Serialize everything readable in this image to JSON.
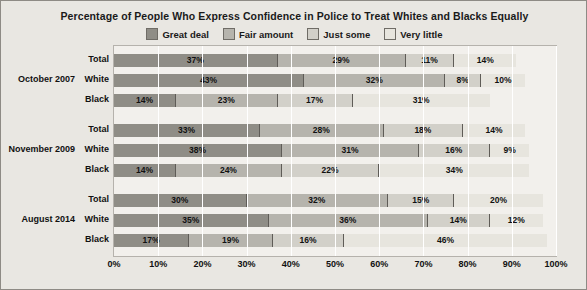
{
  "chart_data": {
    "type": "bar",
    "orientation": "horizontal-stacked",
    "title": "Percentage of People Who Express Confidence in Police to Treat Whites and Blacks Equally",
    "xlabel": "",
    "ylabel": "",
    "xlim": [
      0,
      100
    ],
    "xticks": [
      "0%",
      "10%",
      "20%",
      "30%",
      "40%",
      "50%",
      "60%",
      "70%",
      "80%",
      "90%",
      "100%"
    ],
    "xtick_values": [
      0,
      10,
      20,
      30,
      40,
      50,
      60,
      70,
      80,
      90,
      100
    ],
    "grid": true,
    "legend_position": "top",
    "legend": [
      {
        "name": "Great deal",
        "color": "#8f8d86"
      },
      {
        "name": "Fair amount",
        "color": "#b6b4ad"
      },
      {
        "name": "Just some",
        "color": "#d2d0c9"
      },
      {
        "name": "Very little",
        "color": "#e7e5de"
      }
    ],
    "groups": [
      {
        "label": "October 2007",
        "rows": [
          {
            "category": "Total",
            "values": [
              37,
              29,
              11,
              14
            ],
            "labels": [
              "37%",
              "29%",
              "11%",
              "14%"
            ]
          },
          {
            "category": "White",
            "values": [
              43,
              32,
              8,
              10
            ],
            "labels": [
              "43%",
              "32%",
              "8%",
              "10%"
            ]
          },
          {
            "category": "Black",
            "values": [
              14,
              23,
              17,
              31
            ],
            "labels": [
              "14%",
              "23%",
              "17%",
              "31%"
            ]
          }
        ]
      },
      {
        "label": "November 2009",
        "rows": [
          {
            "category": "Total",
            "values": [
              33,
              28,
              18,
              14
            ],
            "labels": [
              "33%",
              "28%",
              "18%",
              "14%"
            ]
          },
          {
            "category": "White",
            "values": [
              38,
              31,
              16,
              9
            ],
            "labels": [
              "38%",
              "31%",
              "16%",
              "9%"
            ]
          },
          {
            "category": "Black",
            "values": [
              14,
              24,
              22,
              34
            ],
            "labels": [
              "14%",
              "24%",
              "22%",
              "34%"
            ]
          }
        ]
      },
      {
        "label": "August 2014",
        "rows": [
          {
            "category": "Total",
            "values": [
              30,
              32,
              15,
              20
            ],
            "labels": [
              "30%",
              "32%",
              "15%",
              "20%"
            ]
          },
          {
            "category": "White",
            "values": [
              35,
              36,
              14,
              12
            ],
            "labels": [
              "35%",
              "36%",
              "14%",
              "12%"
            ]
          },
          {
            "category": "Black",
            "values": [
              17,
              19,
              16,
              46
            ],
            "labels": [
              "17%",
              "19%",
              "16%",
              "46%"
            ]
          }
        ]
      }
    ]
  }
}
